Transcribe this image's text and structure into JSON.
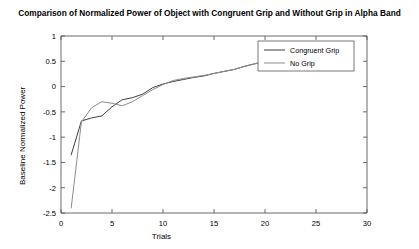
{
  "chart_data": {
    "type": "line",
    "title": "Comparison of Normalized Power of Object with Congruent Grip and Without Grip in Alpha Band",
    "xlabel": "Trials",
    "ylabel": "Baseline Normalized Power",
    "xlim": [
      0,
      30
    ],
    "ylim": [
      -2.5,
      1
    ],
    "xticks": [
      "0",
      "5",
      "10",
      "15",
      "20",
      "25",
      "30"
    ],
    "xtick_values": [
      0,
      5,
      10,
      15,
      20,
      25,
      30
    ],
    "yticks": [
      "1",
      "0.5",
      "0",
      "-0.5",
      "-1",
      "-1.5",
      "-2",
      "-2.5"
    ],
    "ytick_values": [
      1,
      0.5,
      0,
      -0.5,
      -1,
      -1.5,
      -2,
      -2.5
    ],
    "grid": false,
    "legend_position": "top-right",
    "series": [
      {
        "name": "Congruent Grip",
        "color": "#3d3d3d",
        "x": [
          1,
          2,
          3,
          4,
          5,
          6,
          7,
          8,
          9,
          10,
          11,
          12,
          13,
          14,
          15,
          16,
          17,
          18,
          19,
          20,
          21
        ],
        "values": [
          -1.35,
          -0.68,
          -0.62,
          -0.58,
          -0.4,
          -0.26,
          -0.22,
          -0.15,
          -0.02,
          0.05,
          0.1,
          0.14,
          0.18,
          0.21,
          0.26,
          0.3,
          0.34,
          0.4,
          0.45,
          0.5,
          0.55
        ]
      },
      {
        "name": "No Grip",
        "color": "#8c8c8c",
        "x": [
          1,
          2,
          3,
          4,
          5,
          6,
          7,
          8,
          9,
          10,
          11,
          12,
          13,
          14,
          15,
          16,
          17,
          18,
          19,
          20,
          21
        ],
        "values": [
          -2.4,
          -0.7,
          -0.42,
          -0.3,
          -0.33,
          -0.38,
          -0.3,
          -0.18,
          -0.06,
          0.04,
          0.12,
          0.16,
          0.19,
          0.22,
          0.26,
          0.3,
          0.34,
          0.4,
          0.45,
          0.5,
          0.55
        ]
      }
    ]
  }
}
